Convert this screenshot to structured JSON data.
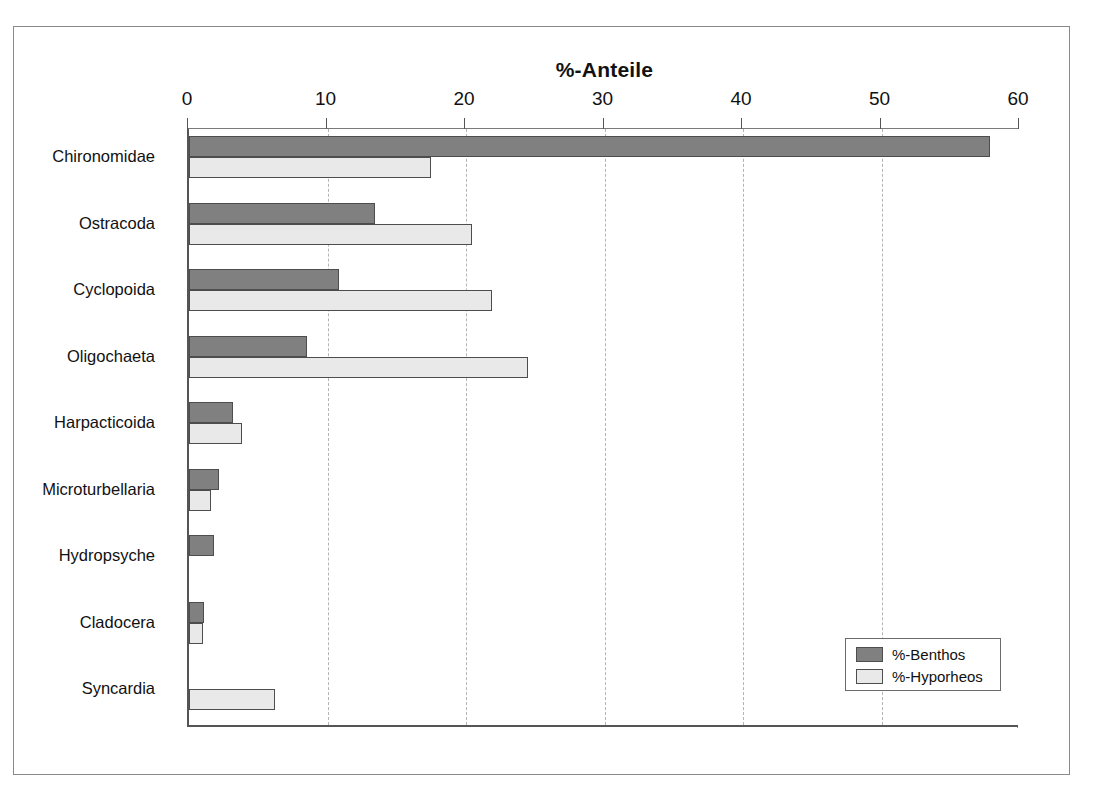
{
  "figure": {
    "title": "%-Anteile"
  },
  "legend": {
    "position": "bottom-right",
    "items": [
      {
        "label": "%-Benthos",
        "color": "#808080"
      },
      {
        "label": "%-Hyporheos",
        "color": "#e9e9e9"
      }
    ]
  },
  "chart_data": {
    "type": "bar",
    "orientation": "horizontal",
    "title": "%-Anteile",
    "xlabel": "",
    "ylabel": "",
    "xlim": [
      0,
      60
    ],
    "xticks": [
      0,
      10,
      20,
      30,
      40,
      50,
      60
    ],
    "xtick_labels": [
      "0",
      "10",
      "20",
      "30",
      "40",
      "50",
      "60"
    ],
    "grid": "vertical-dashed",
    "legend_position": "bottom-right",
    "categories": [
      "Chironomidae",
      "Ostracoda",
      "Cyclopoida",
      "Oligochaeta",
      "Harpacticoida",
      "Microturbellaria",
      "Hydropsyche",
      "Cladocera",
      "Syncardia"
    ],
    "series": [
      {
        "name": "%-Benthos",
        "color": "#808080",
        "values": [
          57.8,
          13.4,
          10.8,
          8.5,
          3.2,
          2.2,
          1.8,
          1.1,
          0
        ]
      },
      {
        "name": "%-Hyporheos",
        "color": "#e9e9e9",
        "values": [
          17.5,
          20.4,
          21.9,
          24.5,
          3.8,
          1.6,
          0,
          1.0,
          6.2
        ]
      }
    ]
  }
}
